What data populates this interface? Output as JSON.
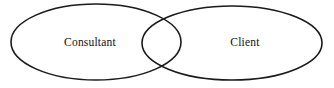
{
  "diagram": {
    "type": "venn-two-circle",
    "background_color": "#ffffff",
    "stroke_color": "#1a1a1a",
    "text_color": "#111111",
    "sets": [
      {
        "id": "consultant",
        "label": "Consultant",
        "center_x": 96,
        "center_y": 42,
        "radius_x": 85,
        "radius_y": 38,
        "label_x": 90,
        "label_y": 43
      },
      {
        "id": "client",
        "label": "Client",
        "center_x": 232,
        "center_y": 43,
        "radius_x": 90,
        "radius_y": 37,
        "label_x": 245,
        "label_y": 43
      }
    ]
  },
  "chart_data": {
    "type": "diagram",
    "title": "",
    "subtitle": "",
    "xlabel": "",
    "ylabel": "",
    "categories": [
      "Consultant",
      "Client"
    ],
    "values": [
      1,
      1
    ],
    "annotations": [
      "Consultant",
      "Client"
    ],
    "legend_position": "none",
    "grid": false
  }
}
